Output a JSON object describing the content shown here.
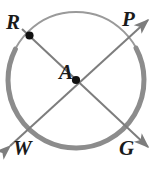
{
  "figure": {
    "kind": "circle-geometry-diagram",
    "canvas": {
      "width": 159,
      "height": 172
    },
    "colors": {
      "background": "#ffffff",
      "circle_stroke": "#9a9a9a",
      "highlight_arc_stroke": "#8c8c8c",
      "line_stroke": "#7d7d7d",
      "point_fill": "#111111",
      "label_text": "#1a1a1a"
    },
    "circle": {
      "label": "circle A",
      "center": {
        "x": 76,
        "y": 80
      },
      "radius": 68,
      "stroke_width": 2
    },
    "highlight_arc": {
      "name": "arc RW",
      "start_angle_deg": -28,
      "end_angle_deg": 207,
      "stroke_width": 5
    },
    "points": [
      {
        "id": "A",
        "label": "A",
        "x": 76,
        "y": 80,
        "on_circle": false,
        "marked": true
      },
      {
        "id": "R",
        "label": "R",
        "x": 28,
        "y": 32,
        "on_circle": true,
        "marked": true
      },
      {
        "id": "P",
        "label": "P",
        "x": 124,
        "y": 32,
        "on_circle": true,
        "marked": false
      },
      {
        "id": "W",
        "label": "W",
        "x": 28,
        "y": 128,
        "on_circle": true,
        "marked": false
      },
      {
        "id": "G",
        "label": "G",
        "x": 124,
        "y": 128,
        "on_circle": true,
        "marked": false
      }
    ],
    "lines": [
      {
        "name": "line PW",
        "through": "A",
        "from": {
          "x": 8,
          "y": 148
        },
        "to": {
          "x": 150,
          "y": 18
        },
        "arrow_start": true,
        "arrow_end": true,
        "stroke_width": 2
      },
      {
        "name": "line RG",
        "through": "A",
        "from": {
          "x": 20,
          "y": 28
        },
        "to": {
          "x": 150,
          "y": 150
        },
        "arrow_start": false,
        "arrow_end": true,
        "stroke_width": 2
      }
    ],
    "labels": {
      "R": "R",
      "P": "P",
      "A": "A",
      "W": "W",
      "G": "G"
    }
  }
}
